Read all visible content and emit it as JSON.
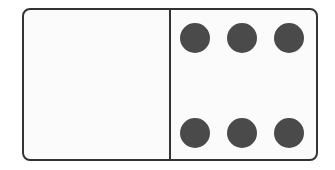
{
  "domino": {
    "left_half_pips": 0,
    "right_half_pips": 6,
    "colors": {
      "border": "#333333",
      "face": "#fbfbfb",
      "pip": "#4a4a4a"
    }
  }
}
